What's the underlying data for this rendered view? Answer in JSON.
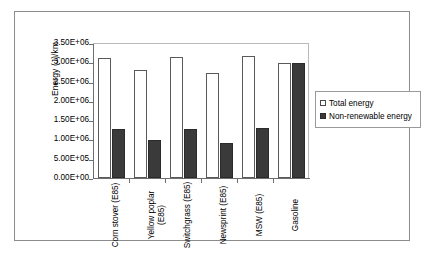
{
  "chart_data": {
    "type": "bar",
    "title": "",
    "xlabel": "",
    "ylabel": "Energy (J)/km",
    "ylim": [
      0,
      3500000
    ],
    "ytick_values": [
      0,
      500000,
      1000000,
      1500000,
      2000000,
      2500000,
      3000000,
      3500000
    ],
    "ytick_labels": [
      "0.00E+00",
      "5.00E+05",
      "1.00E+06",
      "1.50E+06",
      "2.00E+06",
      "2.50E+06",
      "3.00E+06",
      "3.50E+06"
    ],
    "categories": [
      "Corn stover (E85)",
      "Yellow poplar (E85)",
      "Switchgrass (E85)",
      "Newsprint (E85)",
      "MSW (E85)",
      "Gasoline"
    ],
    "series": [
      {
        "name": "Total energy",
        "color": "#ffffff",
        "values": [
          3100000,
          2810000,
          3150000,
          2730000,
          3170000,
          2970000
        ]
      },
      {
        "name": "Non-renewable energy",
        "color": "#3a3a3a",
        "values": [
          1260000,
          980000,
          1280000,
          900000,
          1300000,
          2970000
        ]
      }
    ],
    "legend_position": "right",
    "grid": false
  },
  "legend": {
    "items": [
      {
        "label": "Total energy",
        "swatch": "legend-swatch-total-energy"
      },
      {
        "label": "Non-renewable energy",
        "swatch": "legend-swatch-non-renewable-energy"
      }
    ]
  }
}
